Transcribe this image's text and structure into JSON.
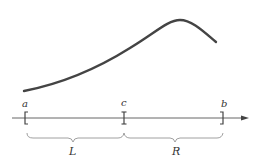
{
  "diagram": {
    "curve": {
      "color": "#444444",
      "points": [
        [
          24,
          91
        ],
        [
          60,
          82
        ],
        [
          120,
          52
        ],
        [
          165,
          24
        ],
        [
          180,
          20
        ],
        [
          195,
          26
        ],
        [
          216,
          42
        ]
      ]
    },
    "axis": {
      "color": "#555555",
      "y": 118,
      "x_start": 12,
      "x_end": 248
    },
    "points": [
      {
        "id": "a",
        "label": "a",
        "x": 25,
        "marker": "left-bracket"
      },
      {
        "id": "c",
        "label": "c",
        "x": 124,
        "marker": "tick"
      },
      {
        "id": "b",
        "label": "b",
        "x": 223,
        "marker": "right-bracket"
      }
    ],
    "intervals": [
      {
        "id": "L",
        "label": "L",
        "from": "a",
        "to": "c"
      },
      {
        "id": "R",
        "label": "R",
        "from": "c",
        "to": "b"
      }
    ]
  }
}
